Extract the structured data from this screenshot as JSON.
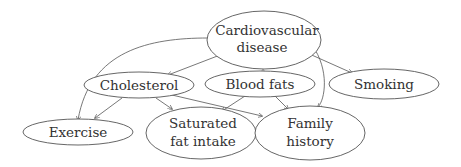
{
  "diagram": {
    "type": "directed-graph",
    "nodes": [
      {
        "id": "cvd",
        "lines": [
          "Cardiovascular",
          "disease"
        ]
      },
      {
        "id": "cholesterol",
        "lines": [
          "Cholesterol"
        ]
      },
      {
        "id": "bloodfats",
        "lines": [
          "Blood fats"
        ]
      },
      {
        "id": "smoking",
        "lines": [
          "Smoking"
        ]
      },
      {
        "id": "exercise",
        "lines": [
          "Exercise"
        ]
      },
      {
        "id": "satfat",
        "lines": [
          "Saturated",
          "fat intake"
        ]
      },
      {
        "id": "family",
        "lines": [
          "Family",
          "history"
        ]
      }
    ],
    "edges": [
      {
        "from": "cvd",
        "to": "exercise"
      },
      {
        "from": "cvd",
        "to": "cholesterol"
      },
      {
        "from": "cvd",
        "to": "bloodfats"
      },
      {
        "from": "cvd",
        "to": "smoking"
      },
      {
        "from": "cvd",
        "to": "family"
      },
      {
        "from": "cholesterol",
        "to": "exercise"
      },
      {
        "from": "cholesterol",
        "to": "satfat"
      },
      {
        "from": "cholesterol",
        "to": "family"
      },
      {
        "from": "bloodfats",
        "to": "satfat"
      },
      {
        "from": "bloodfats",
        "to": "family"
      }
    ]
  }
}
